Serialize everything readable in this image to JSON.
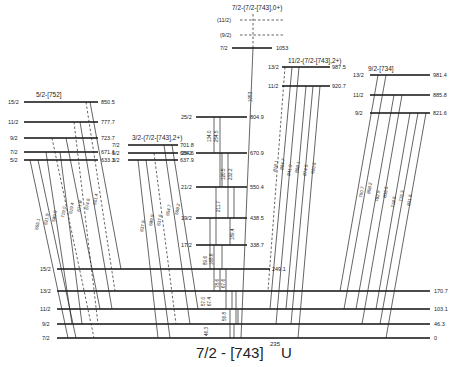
{
  "title": {
    "band": "7/2 - [743]",
    "nucleus_mass": "235",
    "nucleus_symbol": "U"
  },
  "bands": {
    "ground": {
      "label": "7/2 - [743]",
      "levels": [
        {
          "spin": "15/2",
          "energy": "249.1",
          "y": 269
        },
        {
          "spin": "13/2",
          "energy": "170.7",
          "y": 291
        },
        {
          "spin": "11/2",
          "energy": "103.1",
          "y": 309
        },
        {
          "spin": "9/2",
          "energy": "46.3",
          "y": 324
        },
        {
          "spin": "7/2",
          "energy": "0",
          "y": 338
        }
      ]
    },
    "b752": {
      "label": "5/2-[752]",
      "levels": [
        {
          "spin": "15/2",
          "energy": "850.5",
          "y": 102
        },
        {
          "spin": "11/2",
          "energy": "777.7",
          "y": 122
        },
        {
          "spin": "9/2",
          "energy": "723.7",
          "y": 138
        },
        {
          "spin": "7/2",
          "energy": "671.1",
          "y": 152
        },
        {
          "spin": "5/2",
          "energy": "633.1",
          "y": 160
        }
      ],
      "gammas": [
        "655.1",
        "621.9",
        "589.9",
        "719.0",
        "619.4",
        "671.8",
        "674.6",
        "601.4"
      ]
    },
    "b743_2": {
      "label": "3/2-(7/2-[743],2+)",
      "levels": [
        {
          "spin": "7/2",
          "energy": "701.8",
          "y": 145
        },
        {
          "spin": "5/2",
          "energy": "684.6",
          "y": 153
        },
        {
          "spin": "3/2",
          "energy": "637.9",
          "y": 160
        }
      ],
      "gammas": [
        "637.9",
        "689.9",
        "637.6",
        "654.7",
        "598.2"
      ]
    },
    "yrast": {
      "levels": [
        {
          "spin": "25/2",
          "energy": "804.9",
          "y": 117
        },
        {
          "spin": "23/2",
          "energy": "670.9",
          "y": 153
        },
        {
          "spin": "21/2",
          "energy": "550.4",
          "y": 187
        },
        {
          "spin": "19/2",
          "energy": "438.5",
          "y": 218
        },
        {
          "spin": "17/2",
          "energy": "338.7",
          "y": 245
        }
      ],
      "gammas": [
        "134.0",
        "254.5",
        "120.5",
        "232.2",
        "211.7",
        "189.4",
        "89.6",
        "168.6",
        "78.6",
        "67.6",
        "57.0",
        "67.4",
        "56.8",
        "46.3"
      ]
    },
    "b743_0": {
      "label": "7/2-(7/2-[743],0+)",
      "levels": [
        {
          "spin": "(11/2)",
          "energy": "",
          "y": 20,
          "dashed": true
        },
        {
          "spin": "(9/2)",
          "energy": "",
          "y": 35,
          "dashed": true
        },
        {
          "spin": "7/2",
          "energy": "1053",
          "y": 48
        }
      ],
      "gammas": [
        "1053"
      ]
    },
    "b743_2b": {
      "label": "11/2-(7/2-[743],2+)",
      "levels": [
        {
          "spin": "13/2",
          "energy": "987.5",
          "y": 67
        },
        {
          "spin": "11/2",
          "energy": "920.7",
          "y": 86
        }
      ],
      "gammas": [
        "818.1",
        "864.7",
        "841.0",
        "868.1",
        "874.5",
        "920.6"
      ]
    },
    "b734": {
      "label": "9/2-[734]",
      "levels": [
        {
          "spin": "13/2",
          "energy": "981.4",
          "y": 75
        },
        {
          "spin": "11/2",
          "energy": "885.8",
          "y": 95
        },
        {
          "spin": "9/2",
          "energy": "821.6",
          "y": 113
        }
      ],
      "gammas": [
        "790.7",
        "858.2",
        "782.9",
        "835.5",
        "718.6",
        "775.3",
        "821.6"
      ]
    }
  }
}
